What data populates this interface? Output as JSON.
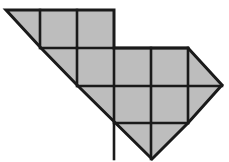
{
  "figure": {
    "type": "geometric-diagram",
    "canvas": {
      "width": 229,
      "height": 162,
      "background": "#ffffff"
    },
    "style": {
      "fill": "#bdbdbd",
      "outline_stroke": "#1a1a1a",
      "outline_width": 3,
      "grid_stroke": "#1a1a1a",
      "grid_width": 2.6
    },
    "lattice": {
      "cell_size": 37,
      "origin_x": 3,
      "origin_y": 10,
      "columns_x": [
        3,
        40,
        77,
        114,
        151,
        188,
        225
      ],
      "rows_y": [
        10,
        48,
        86,
        123,
        160
      ]
    },
    "outline_points": "6,10 114,10 114,48 188,48 222,85 188,123 152,159 78,86 41,48",
    "outline_vertices": [
      {
        "name": "top-left-apex",
        "x": 6,
        "y": 10
      },
      {
        "name": "top-right-corner",
        "x": 114,
        "y": 10
      },
      {
        "name": "step-inner-corner",
        "x": 114,
        "y": 48
      },
      {
        "name": "upper-right-corner",
        "x": 188,
        "y": 48
      },
      {
        "name": "right-apex",
        "x": 222,
        "y": 85
      },
      {
        "name": "lower-right-corner",
        "x": 188,
        "y": 123
      },
      {
        "name": "bottom-apex",
        "x": 152,
        "y": 159
      },
      {
        "name": "left-diagonal-mid",
        "x": 78,
        "y": 86
      },
      {
        "name": "left-diagonal-step",
        "x": 41,
        "y": 48
      }
    ],
    "grid_segments": [
      {
        "name": "vertical-col-40-top",
        "x1": 40,
        "y1": 10,
        "x2": 40,
        "y2": 48
      },
      {
        "name": "vertical-col-77-top",
        "x1": 77,
        "y1": 10,
        "x2": 77,
        "y2": 48
      },
      {
        "name": "vertical-col-77-mid",
        "x1": 77,
        "y1": 48,
        "x2": 77,
        "y2": 86
      },
      {
        "name": "vertical-col-114-mid",
        "x1": 114,
        "y1": 48,
        "x2": 114,
        "y2": 159
      },
      {
        "name": "vertical-col-151-mid",
        "x1": 151,
        "y1": 48,
        "x2": 151,
        "y2": 159
      },
      {
        "name": "vertical-col-188-mid",
        "x1": 188,
        "y1": 48,
        "x2": 188,
        "y2": 123
      },
      {
        "name": "horizontal-row-48",
        "x1": 41,
        "y1": 48,
        "x2": 188,
        "y2": 48
      },
      {
        "name": "horizontal-row-86",
        "x1": 78,
        "y1": 86,
        "x2": 222,
        "y2": 86
      },
      {
        "name": "horizontal-row-123",
        "x1": 114,
        "y1": 123,
        "x2": 188,
        "y2": 123
      }
    ],
    "counts": {
      "full_squares": 9,
      "half_triangles": 6,
      "total_cells": 15
    }
  }
}
